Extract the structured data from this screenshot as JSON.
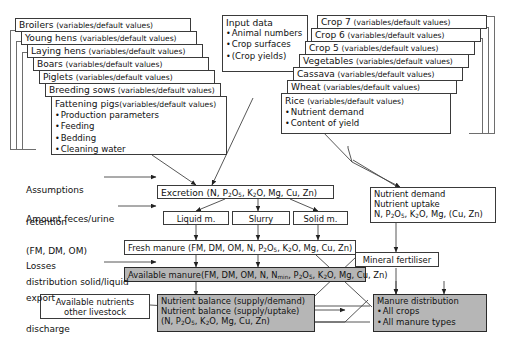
{
  "figure": {
    "type": "flow-diagram",
    "colors": {
      "box_fill": "#ffffff",
      "highlight_fill": "#b6b6b6",
      "stroke": "#3a3a3a",
      "page": "#ffffff"
    }
  },
  "livestock_stack": {
    "cards": [
      {
        "name": "Broilers",
        "qualifier": "(variables/default values)"
      },
      {
        "name": "Young hens",
        "qualifier": "(variables/default values)"
      },
      {
        "name": "Laying hens",
        "qualifier": "(variables/default values)"
      },
      {
        "name": "Boars",
        "qualifier": "(variables/default values)"
      },
      {
        "name": "Piglets",
        "qualifier": "(variables/default values)"
      },
      {
        "name": "Breeding sows",
        "qualifier": "(variables/default values)"
      }
    ],
    "front_card": {
      "name": "Fattening pigs",
      "qualifier": "(variables/default values)",
      "bullets": [
        "Production parameters",
        "Feeding",
        "Bedding",
        "Cleaning water"
      ]
    }
  },
  "crop_stack": {
    "cards": [
      {
        "name": "Crop 7",
        "qualifier": "(variables/default values)"
      },
      {
        "name": "Crop 6",
        "qualifier": "(variables/default values)"
      },
      {
        "name": "Crop 5",
        "qualifier": "(variables/default values)"
      },
      {
        "name": "Vegetables",
        "qualifier": "(variables/default values)"
      },
      {
        "name": "Cassava",
        "qualifier": "(variables/default values)"
      },
      {
        "name": "Wheat",
        "qualifier": "(variables/default values)"
      }
    ],
    "front_card": {
      "name": "Rice",
      "qualifier": "(variables/default values)",
      "bullets": [
        "Nutrient demand",
        "Content of yield"
      ]
    }
  },
  "input_data": {
    "title": "Input data",
    "bullets": [
      "Animal numbers",
      "Crop surfaces",
      "(Crop yields)"
    ]
  },
  "side_labels": [
    {
      "id": "assumptions",
      "lines": [
        "Assumptions",
        "retention"
      ]
    },
    {
      "id": "amount-feces-urine",
      "lines": [
        "Amount feces/urine",
        "(FM, DM, OM)",
        "distribution solid/liquid"
      ]
    },
    {
      "id": "losses",
      "lines": [
        "Losses",
        "export",
        "discharge"
      ]
    }
  ],
  "nodes": {
    "excretion": {
      "label": "Excretion (N, P",
      "sub1": "2",
      "mid1": "O",
      "sub2": "5",
      "mid2": ", K",
      "sub3": "2",
      "tail": "O, Mg, Cu, Zn)"
    },
    "liquid_manure": {
      "label": "Liquid m."
    },
    "slurry": {
      "label": "Slurry"
    },
    "solid_manure": {
      "label": "Solid m."
    },
    "fresh_manure": {
      "label": "Fresh manure (FM, DM, OM, N, P",
      "sub1": "2",
      "mid1": "O",
      "sub2": "5",
      "mid2": ", K",
      "sub3": "2",
      "tail": "O, Mg, Cu, Zn)"
    },
    "available_manure": {
      "label": "Available manure(FM, DM, OM, N, N",
      "subm": "min",
      "mid0": ", P",
      "sub1": "2",
      "mid1": "O",
      "sub2": "5",
      "mid2": ", K",
      "sub3": "2",
      "tail": "O, Mg, Cu, Zn)"
    },
    "nutrient_demand_uptake": {
      "line1": "Nutrient demand",
      "line2": "Nutrient uptake",
      "line3_pre": "N, P",
      "sub1": "2",
      "line3_mid1": "O",
      "sub2": "5",
      "line3_mid2": ", K",
      "sub3": "2",
      "line3_tail": "O, Mg, (Cu, Zn)"
    },
    "mineral_fertiliser": {
      "label": "Mineral fertiliser"
    },
    "available_nutrients_other": {
      "line1": "Available nutrients",
      "line2": "other livestock"
    },
    "nutrient_balance": {
      "line1": "Nutrient balance (supply/demand)",
      "line2": "Nutrient balance (supply/uptake)",
      "line3_pre": "(N, P",
      "sub1": "2",
      "line3_mid1": "O",
      "sub2": "5",
      "line3_mid2": ", K",
      "sub3": "2",
      "line3_tail": "O, Mg, Cu, Zn)"
    },
    "manure_distribution": {
      "title": "Manure distribution",
      "bullets": [
        "All crops",
        "All manure types"
      ]
    }
  }
}
